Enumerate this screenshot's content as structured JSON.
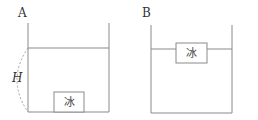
{
  "diagram": {
    "containerA": {
      "label": "A",
      "height_label": "H",
      "block_label": "冰"
    },
    "containerB": {
      "label": "B",
      "block_label": "冰"
    },
    "colors": {
      "line": "#8a8a8a",
      "dashed": "#a0a0a0",
      "text": "#333333"
    }
  }
}
